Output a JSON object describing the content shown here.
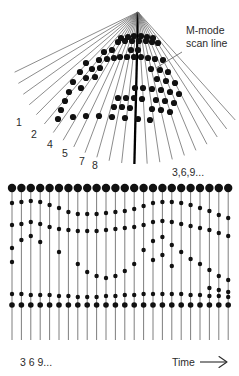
{
  "figure": {
    "background": "#ffffff",
    "ink": "#111111",
    "label_color": "#2b2b2b",
    "line_color": "#6f6f6f",
    "bold_line_color": "#000000"
  },
  "labels": {
    "m_mode_line1": "M-mode",
    "m_mode_line2": "scan line",
    "scan_numbers": [
      "1",
      "2",
      "4",
      "5",
      "7",
      "8"
    ],
    "repeat_sequence_top": "3,6,9...",
    "repeat_sequence_bottom": "3 6 9...",
    "time_axis": "Time"
  },
  "chart_data": {
    "type": "scatter",
    "panels": [
      {
        "name": "sector-scan-fan",
        "apex": [
          138,
          12
        ],
        "beam_count": 23,
        "fan_start_angle_deg": -64,
        "fan_end_angle_deg": 42,
        "numbered_beams": [
          {
            "label": "1",
            "index": 0,
            "x": 16,
            "y": 126
          },
          {
            "label": "2",
            "index": 1,
            "x": 31,
            "y": 138
          },
          {
            "label": "4",
            "index": 2,
            "x": 47,
            "y": 148
          },
          {
            "label": "5",
            "index": 3,
            "x": 62,
            "y": 157
          },
          {
            "label": "7",
            "index": 4,
            "x": 79,
            "y": 165
          },
          {
            "label": "8",
            "index": 5,
            "x": 92,
            "y": 169
          }
        ],
        "m_mode_beam_index": 13,
        "m_mode_beam_bold": true,
        "pointer": {
          "from": [
            182,
            52
          ],
          "to": [
            156,
            68
          ]
        },
        "echo_dots": [
          [
            121,
            38
          ],
          [
            128,
            37
          ],
          [
            134,
            36
          ],
          [
            141,
            36
          ],
          [
            147,
            37
          ],
          [
            153,
            38
          ],
          [
            118,
            42
          ],
          [
            125,
            41
          ],
          [
            132,
            41
          ],
          [
            139,
            41
          ],
          [
            146,
            41
          ],
          [
            152,
            42
          ],
          [
            158,
            43
          ],
          [
            104,
            52
          ],
          [
            112,
            50
          ],
          [
            131,
            50
          ],
          [
            138,
            50
          ],
          [
            86,
            63
          ],
          [
            99,
            60
          ],
          [
            107,
            59
          ],
          [
            114,
            58
          ],
          [
            120,
            57
          ],
          [
            127,
            57
          ],
          [
            134,
            57
          ],
          [
            141,
            57
          ],
          [
            148,
            58
          ],
          [
            155,
            59
          ],
          [
            163,
            60
          ],
          [
            80,
            72
          ],
          [
            92,
            69
          ],
          [
            100,
            68
          ],
          [
            151,
            69
          ],
          [
            160,
            70
          ],
          [
            168,
            72
          ],
          [
            73,
            82
          ],
          [
            86,
            78
          ],
          [
            95,
            77
          ],
          [
            157,
            79
          ],
          [
            166,
            81
          ],
          [
            175,
            83
          ],
          [
            69,
            92
          ],
          [
            81,
            88
          ],
          [
            135,
            88
          ],
          [
            143,
            88
          ],
          [
            152,
            89
          ],
          [
            161,
            90
          ],
          [
            170,
            92
          ],
          [
            179,
            94
          ],
          [
            65,
            101
          ],
          [
            118,
            98
          ],
          [
            126,
            98
          ],
          [
            134,
            98
          ],
          [
            142,
            99
          ],
          [
            156,
            100
          ],
          [
            165,
            101
          ],
          [
            174,
            103
          ],
          [
            61,
            110
          ],
          [
            114,
            107
          ],
          [
            122,
            107
          ],
          [
            130,
            108
          ],
          [
            152,
            109
          ],
          [
            161,
            110
          ],
          [
            170,
            112
          ],
          [
            58,
            119
          ],
          [
            73,
            117
          ],
          [
            86,
            116
          ],
          [
            99,
            116
          ],
          [
            112,
            117
          ],
          [
            125,
            118
          ],
          [
            138,
            119
          ],
          [
            150,
            120
          ]
        ]
      },
      {
        "name": "m-mode-time-display",
        "left": 12,
        "right": 228,
        "top": 186,
        "bottom": 340,
        "trace_count": 24,
        "trace_spacing": 9.4,
        "top_dot_radius": 4.2,
        "mid_dot_radius": 2.2,
        "baseline_dot_radius": 2.8,
        "top_row_y": 188,
        "baseline_row_y": 305,
        "line_end_y": 340,
        "traces": [
          {
            "i": 0,
            "dots": [
              203,
              225,
              248,
              262,
              294
            ]
          },
          {
            "i": 1,
            "dots": [
              202,
              224,
              240,
              294
            ]
          },
          {
            "i": 2,
            "dots": [
              201,
              222,
              236,
              295
            ]
          },
          {
            "i": 3,
            "dots": [
              202,
              224,
              242,
              295
            ]
          },
          {
            "i": 4,
            "dots": [
              205,
              227,
              295
            ]
          },
          {
            "i": 5,
            "dots": [
              208,
              229,
              252,
              296
            ]
          },
          {
            "i": 6,
            "dots": [
              212,
              230,
              296
            ]
          },
          {
            "i": 7,
            "dots": [
              214,
              231,
              264,
              297
            ]
          },
          {
            "i": 8,
            "dots": [
              214,
              231,
              272,
              297
            ]
          },
          {
            "i": 9,
            "dots": [
              214,
              231,
              276,
              297
            ]
          },
          {
            "i": 10,
            "dots": [
              213,
              230,
              278,
              296
            ]
          },
          {
            "i": 11,
            "dots": [
              212,
              229,
              276,
              296
            ]
          },
          {
            "i": 12,
            "dots": [
              211,
              228,
              271,
              295
            ]
          },
          {
            "i": 13,
            "dots": [
              209,
              227,
              264,
              295
            ]
          },
          {
            "i": 14,
            "dots": [
              206,
              225,
              250,
              294
            ]
          },
          {
            "i": 15,
            "dots": [
              203,
              222,
              241,
              260,
              294
            ]
          },
          {
            "i": 16,
            "dots": [
              202,
              221,
              237,
              255,
              294
            ]
          },
          {
            "i": 17,
            "dots": [
              202,
              222,
              245,
              266,
              294
            ]
          },
          {
            "i": 18,
            "dots": [
              203,
              224,
              252,
              294
            ]
          },
          {
            "i": 19,
            "dots": [
              205,
              226,
              259,
              295
            ]
          },
          {
            "i": 20,
            "dots": [
              208,
              228,
              264,
              295
            ]
          },
          {
            "i": 21,
            "dots": [
              211,
              230,
              270,
              288,
              296
            ]
          },
          {
            "i": 22,
            "dots": [
              215,
              233,
              276,
              290,
              296
            ]
          },
          {
            "i": 23,
            "dots": [
              218,
              236,
              280,
              292,
              297
            ]
          }
        ]
      }
    ],
    "xlabel": "Time",
    "ylabel": "",
    "grid": false,
    "legend": null,
    "annotations": [
      {
        "text": "M-mode scan line",
        "x": 182,
        "y": 40
      },
      {
        "text": "3,6,9...",
        "x": 172,
        "y": 172
      },
      {
        "text": "3 6 9...",
        "x": 20,
        "y": 362
      },
      {
        "text": "Time",
        "x": 172,
        "y": 362
      }
    ]
  }
}
